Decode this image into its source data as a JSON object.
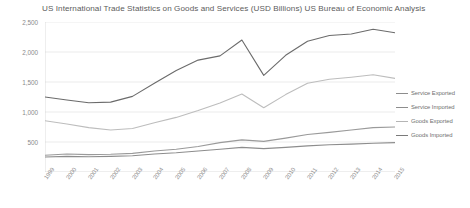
{
  "chart_data": {
    "type": "line",
    "title": "US International Trade Statistics on Goods and Services (USD Billions) US Bureau of Economic Analysis",
    "xlabel": "",
    "ylabel": "",
    "ylim": [
      0,
      2500
    ],
    "yticks": [
      500,
      1000,
      1500,
      2000,
      2500
    ],
    "ytick_labels": [
      "500",
      "1,000",
      "1,500",
      "2,000",
      "2,500"
    ],
    "grid": true,
    "legend_position": "right",
    "categories": [
      "1999",
      "2000",
      "2001",
      "2002",
      "2003",
      "2004",
      "2005",
      "2006",
      "2007",
      "2008",
      "2009",
      "2010",
      "2011",
      "2012",
      "2013",
      "2014",
      "2015"
    ],
    "series": [
      {
        "name": "Service Exported",
        "color": "#9a9a9a",
        "values": [
          280,
          300,
          290,
          295,
          310,
          350,
          380,
          425,
          490,
          535,
          510,
          565,
          625,
          660,
          700,
          740,
          750
        ]
      },
      {
        "name": "Service Imported",
        "color": "#8d8d8d",
        "values": [
          250,
          260,
          255,
          260,
          270,
          300,
          320,
          350,
          380,
          410,
          390,
          410,
          435,
          455,
          465,
          480,
          490
        ]
      },
      {
        "name": "Goods Exported",
        "color": "#bdbdbd",
        "values": [
          855,
          800,
          740,
          700,
          725,
          820,
          910,
          1025,
          1150,
          1300,
          1070,
          1290,
          1480,
          1545,
          1580,
          1620,
          1560
        ]
      },
      {
        "name": "Goods Imported",
        "color": "#6b6b6b",
        "values": [
          1250,
          1200,
          1155,
          1165,
          1260,
          1480,
          1690,
          1865,
          1935,
          2200,
          1610,
          1945,
          2180,
          2275,
          2300,
          2380,
          2320
        ]
      }
    ]
  },
  "legend": {
    "items": [
      {
        "label": "Service Exported",
        "color": "#8d8d8d"
      },
      {
        "label": "Service Imported",
        "color": "#8d8d8d"
      },
      {
        "label": "Goods Exported",
        "color": "#b5b5b5"
      },
      {
        "label": "Goods Imported",
        "color": "#7a7a7a"
      }
    ]
  }
}
